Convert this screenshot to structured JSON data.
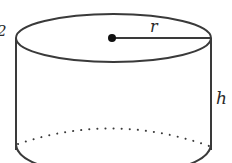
{
  "diagram": {
    "type": "cylinder",
    "labels": {
      "radius": "r",
      "height": "h",
      "left_edge_fragment": "2"
    },
    "colors": {
      "stroke": "#3a3a3a",
      "background": "#ffffff",
      "center_dot": "#111111"
    }
  }
}
